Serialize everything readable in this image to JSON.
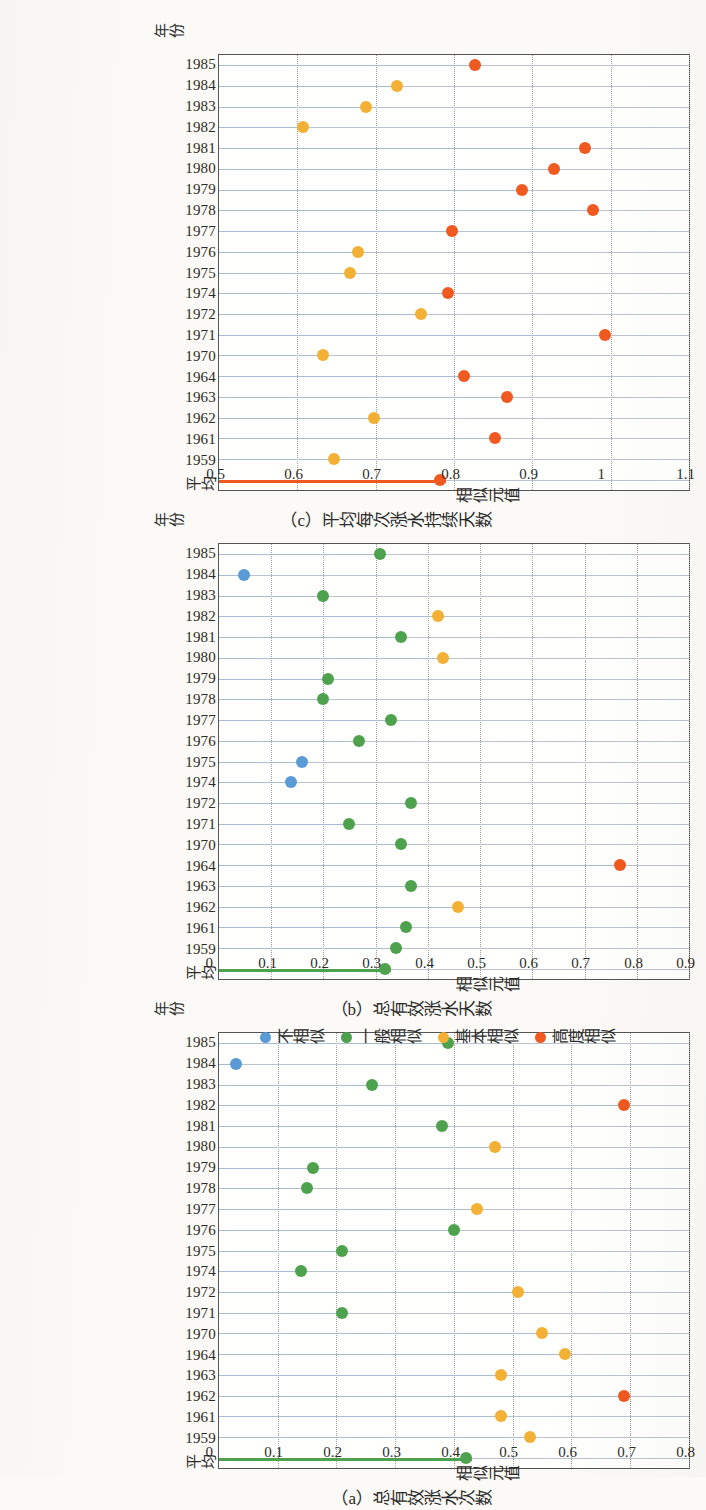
{
  "figure": {
    "axis_category_label": "年份",
    "axis_value_label": "相似元值"
  },
  "legend": {
    "position": "below-middle-panel",
    "items": [
      {
        "label": "不相似",
        "color": "#5b9bd5"
      },
      {
        "label": "一般相似",
        "color": "#4ea24e"
      },
      {
        "label": "基本相似",
        "color": "#f2b134"
      },
      {
        "label": "高度相似",
        "color": "#f0591f"
      }
    ]
  },
  "colors": {
    "not_similar": "#5b9bd5",
    "general_similar": "#4ea24e",
    "basic_similar": "#f2b134",
    "high_similar": "#f0591f",
    "stem": "#a9bcd0",
    "avg_stem_a": "#4ea24e",
    "avg_stem_b": "#4ea24e",
    "avg_stem_c": "#f0591f"
  },
  "chart_data": [
    {
      "id": "a",
      "type": "bar",
      "title": "（a）总有效涨水次数",
      "xlabel": "年份",
      "ylabel": "相似元值",
      "ylim": [
        0,
        0.8
      ],
      "ytick_step": 0.1,
      "yticks": [
        "0",
        "0.1",
        "0.2",
        "0.3",
        "0.4",
        "0.5",
        "0.6",
        "0.7",
        "0.8"
      ],
      "grid": true,
      "categories": [
        "1985",
        "1984",
        "1983",
        "1982",
        "1981",
        "1980",
        "1979",
        "1978",
        "1977",
        "1976",
        "1975",
        "1974",
        "1972",
        "1971",
        "1970",
        "1964",
        "1963",
        "1962",
        "1961",
        "1959",
        "平均"
      ],
      "values": [
        0.4,
        0.04,
        0.27,
        0.7,
        0.39,
        0.48,
        0.17,
        0.16,
        0.45,
        0.41,
        0.22,
        0.15,
        0.52,
        0.22,
        0.56,
        0.6,
        0.49,
        0.7,
        0.49,
        0.54,
        0.43
      ],
      "classes": [
        "general_similar",
        "not_similar",
        "general_similar",
        "high_similar",
        "general_similar",
        "basic_similar",
        "general_similar",
        "general_similar",
        "basic_similar",
        "general_similar",
        "general_similar",
        "general_similar",
        "basic_similar",
        "general_similar",
        "basic_similar",
        "basic_similar",
        "basic_similar",
        "high_similar",
        "basic_similar",
        "basic_similar",
        "general_similar"
      ]
    },
    {
      "id": "b",
      "type": "bar",
      "title": "（b）总有效涨水天数",
      "xlabel": "年份",
      "ylabel": "相似元值",
      "ylim": [
        0,
        0.9
      ],
      "ytick_step": 0.1,
      "yticks": [
        "0",
        "0.1",
        "0.2",
        "0.3",
        "0.4",
        "0.5",
        "0.6",
        "0.7",
        "0.8",
        "0.9"
      ],
      "grid": true,
      "categories": [
        "1985",
        "1984",
        "1983",
        "1982",
        "1981",
        "1980",
        "1979",
        "1978",
        "1977",
        "1976",
        "1975",
        "1974",
        "1972",
        "1971",
        "1970",
        "1964",
        "1963",
        "1962",
        "1961",
        "1959",
        "平均"
      ],
      "values": [
        0.32,
        0.06,
        0.21,
        0.43,
        0.36,
        0.44,
        0.22,
        0.21,
        0.34,
        0.28,
        0.17,
        0.15,
        0.38,
        0.26,
        0.36,
        0.78,
        0.38,
        0.47,
        0.37,
        0.35,
        0.33
      ],
      "classes": [
        "general_similar",
        "not_similar",
        "general_similar",
        "basic_similar",
        "general_similar",
        "basic_similar",
        "general_similar",
        "general_similar",
        "general_similar",
        "general_similar",
        "not_similar",
        "not_similar",
        "general_similar",
        "general_similar",
        "general_similar",
        "high_similar",
        "general_similar",
        "basic_similar",
        "general_similar",
        "general_similar",
        "general_similar"
      ]
    },
    {
      "id": "c",
      "type": "bar",
      "title": "（c）平均每次涨水持续天数",
      "xlabel": "年份",
      "ylabel": "相似元值",
      "ylim": [
        0.5,
        1.1
      ],
      "ytick_step": 0.1,
      "yticks": [
        "0.5",
        "0.6",
        "0.7",
        "0.8",
        "0.9",
        "1",
        "1.1"
      ],
      "grid": true,
      "categories": [
        "1985",
        "1984",
        "1983",
        "1982",
        "1981",
        "1980",
        "1979",
        "1978",
        "1977",
        "1976",
        "1975",
        "1974",
        "1972",
        "1971",
        "1970",
        "1964",
        "1963",
        "1962",
        "1961",
        "1959",
        "平均"
      ],
      "values": [
        0.835,
        0.735,
        0.695,
        0.615,
        0.975,
        0.935,
        0.895,
        0.985,
        0.805,
        0.685,
        0.675,
        0.8,
        0.765,
        1.0,
        0.64,
        0.82,
        0.875,
        0.705,
        0.86,
        0.655,
        0.79
      ],
      "classes": [
        "high_similar",
        "basic_similar",
        "basic_similar",
        "basic_similar",
        "high_similar",
        "high_similar",
        "high_similar",
        "high_similar",
        "high_similar",
        "basic_similar",
        "basic_similar",
        "high_similar",
        "basic_similar",
        "high_similar",
        "basic_similar",
        "high_similar",
        "high_similar",
        "basic_similar",
        "high_similar",
        "basic_similar",
        "high_similar"
      ]
    }
  ]
}
